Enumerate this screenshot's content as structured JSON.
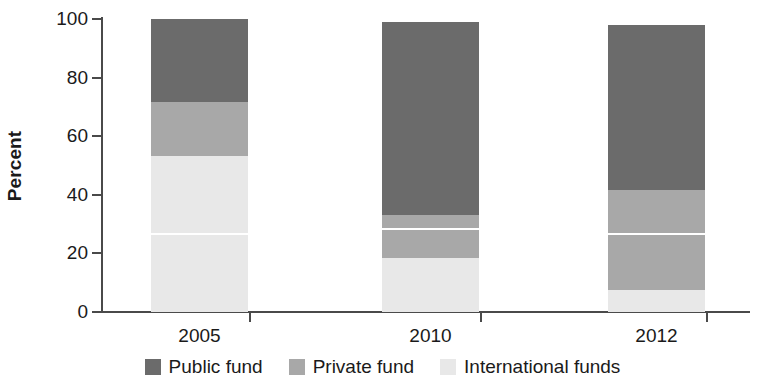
{
  "chart_data": {
    "type": "bar",
    "subtype": "stacked-bar-100-percent",
    "title": "",
    "xlabel": "",
    "ylabel": "Percent",
    "ylim": [
      0,
      100
    ],
    "yticks": [
      0,
      20,
      40,
      60,
      80,
      100
    ],
    "ytick_labels": [
      "0",
      "20",
      "40",
      "60",
      "80",
      "100"
    ],
    "grid": false,
    "legend_position": "bottom",
    "categories": [
      "2005",
      "2010",
      "2012"
    ],
    "series": [
      {
        "name": "Public fund",
        "color": "#6b6b6b",
        "values": [
          28.3,
          66.0,
          56.4
        ]
      },
      {
        "name": "Private fund",
        "color": "#a8a8a8",
        "values": [
          18.4,
          14.6,
          34.1
        ]
      },
      {
        "name": "International funds",
        "color": "#e8e8e8",
        "values": [
          53.3,
          18.4,
          7.5
        ]
      }
    ],
    "segment_tops": {
      "2005": {
        "international_funds": 53.3,
        "private_fund": 71.7,
        "public_fund": 100.0
      },
      "2010": {
        "international_funds": 18.4,
        "private_fund": 33.0,
        "public_fund": 99.0
      },
      "2012": {
        "international_funds": 7.5,
        "private_fund": 41.6,
        "public_fund": 98.0
      }
    },
    "internal_dividers": {
      "2005": 27.0,
      "2010": 28.5,
      "2012": 27.0
    },
    "bar_tops": [
      100.0,
      99.0,
      98.0
    ]
  },
  "axis": {
    "y_title": "Percent"
  },
  "legend": {
    "items": [
      {
        "label": "Public fund",
        "color": "#6b6b6b"
      },
      {
        "label": "Private fund",
        "color": "#a8a8a8"
      },
      {
        "label": "International funds",
        "color": "#e8e8e8"
      }
    ]
  }
}
